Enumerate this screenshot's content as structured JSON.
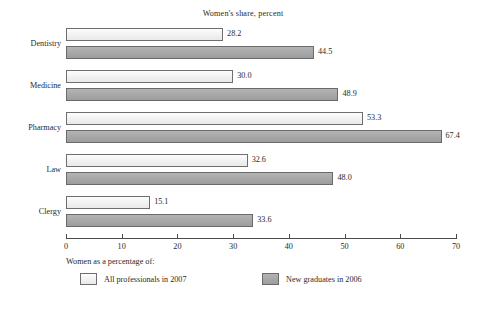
{
  "chart_data": {
    "type": "bar",
    "orientation": "horizontal",
    "title": "Women's share, percent",
    "xlabel": "",
    "ylabel": "",
    "xlim": [
      0,
      70
    ],
    "xticks": [
      0,
      10,
      20,
      30,
      40,
      50,
      60,
      70
    ],
    "xtick_labels": [
      "0",
      "10",
      "20",
      "30",
      "40",
      "50",
      "60",
      "70"
    ],
    "grid": false,
    "legend_position": "below-axis",
    "legend_title": "Women as a percentage of:",
    "categories": [
      "Dentistry",
      "Medicine",
      "Pharmacy",
      "Law",
      "Clergy"
    ],
    "series": [
      {
        "name": "All professionals in 2007",
        "color": "#f3f3f3",
        "values": [
          28.2,
          30.0,
          53.3,
          32.6,
          15.1
        ],
        "labels": [
          "28.2",
          "30.0",
          "53.3",
          "32.6",
          "15.1"
        ]
      },
      {
        "name": "New graduates in 2006",
        "color": "#a9a9a9",
        "values": [
          44.5,
          48.9,
          67.4,
          48.0,
          33.6
        ],
        "labels": [
          "44.5",
          "48.9",
          "67.4",
          "48.0",
          "33.6"
        ]
      }
    ]
  }
}
